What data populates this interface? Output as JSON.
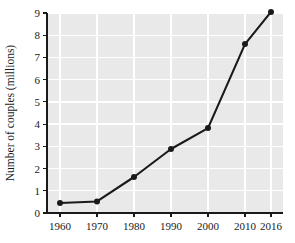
{
  "chart_data": {
    "type": "line",
    "title": "",
    "subtitle": "",
    "xlabel": "",
    "ylabel": "Number of couples (millions)",
    "x": [
      1960,
      1970,
      1980,
      1990,
      2000,
      2010,
      2016
    ],
    "xtick_labels": [
      "1960",
      "1970",
      "1980",
      "1990",
      "2000",
      "2010",
      "2016"
    ],
    "values": [
      0.45,
      0.52,
      1.62,
      2.88,
      3.82,
      7.6,
      9.05
    ],
    "series": [
      {
        "name": "Number of couples",
        "values": [
          0.45,
          0.52,
          1.62,
          2.88,
          3.82,
          7.6,
          9.05
        ]
      }
    ],
    "ylim": [
      0,
      9
    ],
    "yticks": [
      0,
      1,
      2,
      3,
      4,
      5,
      6,
      7,
      8,
      9
    ],
    "ytick_labels": [
      "0",
      "1",
      "2",
      "3",
      "4",
      "5",
      "6",
      "7",
      "8",
      "9"
    ],
    "grid": true,
    "legend": false,
    "legend_position": "none",
    "marker": "circle",
    "colors": {
      "line": "#1a1a1a",
      "marker": "#1a1a1a",
      "plot_background": "#e9e9e9",
      "gridline": "#ffffff",
      "axis": "#1a1a1a",
      "text": "#1a1a1a",
      "figure_background": "#ffffff"
    }
  },
  "layout": {
    "plot_left": 47,
    "plot_right": 283,
    "plot_top": 13,
    "plot_bottom": 213,
    "xtick_positions": [
      60,
      97,
      134,
      171,
      208,
      245,
      271
    ],
    "ylabel_x": 14,
    "ylabel_y": 113
  }
}
